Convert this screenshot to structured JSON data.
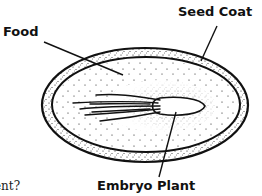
{
  "diagram": {
    "labels": {
      "seed_coat": "Seed Coat",
      "food": "Food",
      "embryo_plant": "Embryo Plant"
    },
    "question_fragment": "ent?"
  },
  "colors": {
    "ink": "#111111",
    "background": "#ffffff"
  }
}
